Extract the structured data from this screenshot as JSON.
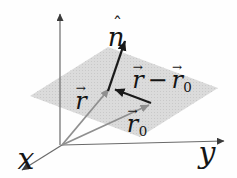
{
  "labels": {
    "axis_x": "x",
    "axis_y": "y",
    "normal": {
      "letter": "n",
      "hat": "ˆ"
    },
    "r": {
      "letter": "r",
      "arrow": "→"
    },
    "r0": {
      "letter": "r",
      "arrow": "→",
      "subscript": "0"
    },
    "difference": {
      "left_letter": "r",
      "left_arrow": "→",
      "operator": "−",
      "right_letter": "r",
      "right_arrow": "→",
      "right_subscript": "0"
    }
  },
  "colors": {
    "background": "#fefefe",
    "plane_fill": "#dbdbdb",
    "plane_dots": "#c9c9c9",
    "gray_vector": "#8f8f8f",
    "black_vector": "#1a1a1a",
    "axis_line": "#6a6a6a",
    "text": "#151515"
  }
}
